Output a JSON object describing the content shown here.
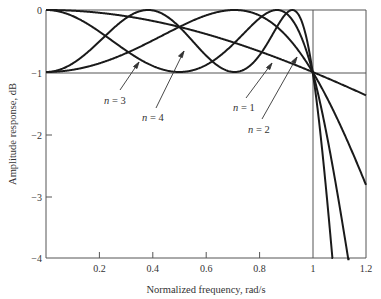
{
  "chart_data": {
    "type": "line",
    "title": "",
    "xlabel": "Normalized frequency, rad/s",
    "ylabel": "Amplitude response, dB",
    "xlim": [
      0,
      1.2
    ],
    "ylim": [
      -4,
      0
    ],
    "x_ticks": [
      "0.2",
      "0.4",
      "0.6",
      "0.8",
      "1",
      "1.2"
    ],
    "y_ticks": [
      "0",
      "−1",
      "−2",
      "−3",
      "−4"
    ],
    "gridlines": {
      "horizontal_at": [
        -1
      ],
      "vertical_at": [
        1
      ]
    },
    "ripple_dB": 1,
    "series": [
      {
        "name": "n = 1",
        "order": 1,
        "values_desc": "monotonic from 0 dB at ω=0, -1 dB at ω=1, about -2.7 dB at ω=1.2"
      },
      {
        "name": "n = 2",
        "order": 2,
        "values_desc": "starts -1 dB at ω=0, peak 0 dB near ω=0.71, -1 dB at ω=1"
      },
      {
        "name": "n = 3",
        "order": 3,
        "values_desc": "starts 0 dB, dip -1 dB near ω=0.5, peak 0 dB near ω=0.87, -1 dB at ω=1"
      },
      {
        "name": "n = 4",
        "order": 4,
        "values_desc": "starts -1 dB, peaks 0 dB at ω≈0.38 and 0.92, dip -1 dB at ω≈0.71, -1 dB at ω=1"
      }
    ],
    "labels": [
      "n = 1",
      "n = 2",
      "n = 3",
      "n = 4"
    ]
  },
  "axes": {
    "xlabel": "Normalized frequency, rad/s",
    "ylabel": "Amplitude response, dB"
  },
  "legend": {
    "n1": "n = 1",
    "n2": "n = 2",
    "n3": "n = 3",
    "n4": "n = 4"
  },
  "ticks": {
    "x": [
      "0.2",
      "0.4",
      "0.6",
      "0.8",
      "1",
      "1.2"
    ],
    "y": [
      "0",
      "−1",
      "−2",
      "−3",
      "−4"
    ]
  }
}
